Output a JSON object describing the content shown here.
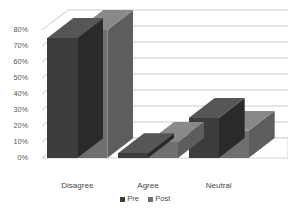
{
  "chart_data": {
    "type": "bar",
    "title": "",
    "subtitle": "",
    "xlabel": "",
    "ylabel": "",
    "categories": [
      "Disagree",
      "Agree",
      "Neutral"
    ],
    "series": [
      {
        "name": "Pre",
        "color": "#3c3c3c",
        "values": [
          75,
          3,
          25
        ]
      },
      {
        "name": "Post",
        "color": "#6f6f6f",
        "values": [
          80,
          10,
          17
        ]
      }
    ],
    "ylim": [
      0,
      80
    ],
    "ytick_step": 10,
    "ytick_labels": [
      "0%",
      "10%",
      "20%",
      "30%",
      "40%",
      "50%",
      "60%",
      "70%",
      "80%"
    ],
    "ytick_values": [
      0,
      10,
      20,
      30,
      40,
      50,
      60,
      70,
      80
    ],
    "grid": true,
    "grid_axis": "y",
    "legend": true,
    "legend_position": "bottom",
    "three_d": true,
    "value_suffix": "%"
  },
  "style": {
    "background": "#ffffff",
    "grid_color": "#bfbfbf",
    "axis_text_color": "#555555",
    "label_text_color": "#4a4a4a",
    "floor_color": "#ffffff",
    "floor_edge": "#c9c9c9"
  }
}
